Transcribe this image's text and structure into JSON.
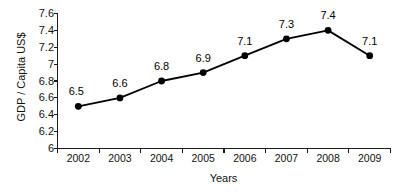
{
  "chart_data": {
    "type": "line",
    "title": "",
    "xlabel": "Years",
    "ylabel": "GDP / Capita US$",
    "categories": [
      "2002",
      "2003",
      "2004",
      "2005",
      "2006",
      "2007",
      "2008",
      "2009"
    ],
    "values": [
      6.5,
      6.6,
      6.8,
      6.9,
      7.1,
      7.3,
      7.4,
      7.1
    ],
    "point_labels": [
      "6.5",
      "6.6",
      "6.8",
      "6.9",
      "7.1",
      "7.3",
      "7.4",
      "7.1"
    ],
    "ylim": [
      6,
      7.6
    ],
    "yticks": [
      6,
      6.2,
      6.4,
      6.6,
      6.8,
      7,
      7.2,
      7.4,
      7.6
    ],
    "ytick_labels": [
      "6",
      "6.2",
      "6.4",
      "6.6",
      "6.8",
      "7",
      "7.2",
      "7.4",
      "7.6"
    ],
    "grid": false,
    "legend": "none",
    "marker": "filled-circle",
    "line_color": "#000000",
    "marker_color": "#000000",
    "background_color": "#ffffff"
  }
}
